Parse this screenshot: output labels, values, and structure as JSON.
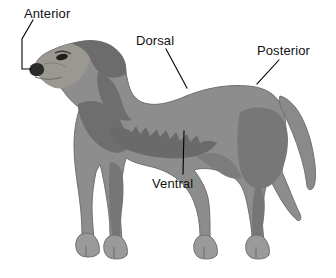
{
  "figure": {
    "background_color": "#ffffff",
    "width": 336,
    "height": 278
  },
  "subject": {
    "name": "dog",
    "view": "lateral left-facing",
    "colors": {
      "body_fill": "#8d8d8d",
      "body_shadow": "#6e6e6e",
      "body_dark": "#5a5a5a",
      "body_light": "#a2a2a2",
      "muzzle_light": "#9a9790",
      "nose": "#2b2b2b",
      "eye": "#1f1f1f",
      "outline": "#6a6a6a"
    }
  },
  "annotations": [
    {
      "id": "anterior",
      "label": "Anterior",
      "pointer_type": "bracket",
      "points_to": "head-nose-front",
      "label_x": 24,
      "label_y": 6
    },
    {
      "id": "dorsal",
      "label": "Dorsal",
      "pointer_type": "leader-line",
      "points_to": "back-topline",
      "label_x": 136,
      "label_y": 33
    },
    {
      "id": "posterior",
      "label": "Posterior",
      "pointer_type": "leader-line",
      "points_to": "rump-tail-base",
      "label_x": 257,
      "label_y": 43
    },
    {
      "id": "ventral",
      "label": "Ventral",
      "pointer_type": "leader-line",
      "points_to": "belly-underside",
      "label_x": 152,
      "label_y": 176
    }
  ],
  "leader_line": {
    "color": "#000000",
    "width": 1
  }
}
